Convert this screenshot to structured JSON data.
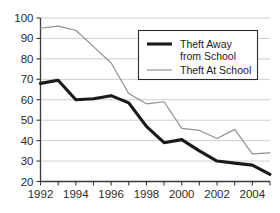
{
  "chart_data": {
    "type": "line",
    "title": "",
    "xlabel": "",
    "ylabel": "",
    "x": [
      1992,
      1993,
      1994,
      1995,
      1996,
      1997,
      1998,
      1999,
      2000,
      2001,
      2002,
      2003,
      2004,
      2005
    ],
    "xlim": [
      1992,
      2005
    ],
    "ylim": [
      20,
      100
    ],
    "yticks": [
      20,
      30,
      40,
      50,
      60,
      70,
      80,
      90,
      100
    ],
    "ytick_labels": [
      "20",
      "30",
      "40",
      "50",
      "60",
      "70",
      "80",
      "90",
      "100"
    ],
    "xtick_labels": [
      "1992",
      "1994",
      "1996",
      "1998",
      "2000",
      "2002",
      "2004"
    ],
    "xticks_labeled": [
      1992,
      1994,
      1996,
      1998,
      2000,
      2002,
      2004
    ],
    "grid": "horizontal",
    "legend_position": "top-right",
    "series": [
      {
        "name": "Theft Away from School",
        "style": "thick-dark",
        "color": "#1a1a1a",
        "values": [
          68,
          69.5,
          60,
          60.5,
          62,
          58.5,
          47,
          39,
          40.5,
          35,
          30,
          29,
          28,
          23.5
        ]
      },
      {
        "name": "Theft At School",
        "style": "thin-gray",
        "color": "#8f8f8f",
        "values": [
          95,
          96,
          94,
          86,
          78,
          63,
          58,
          59,
          46,
          45,
          41,
          45.5,
          33.5,
          34
        ]
      }
    ]
  },
  "legend": {
    "entries": [
      {
        "line1": "Theft Away",
        "line2": "from School"
      },
      {
        "line1": "Theft At School",
        "line2": ""
      }
    ]
  },
  "caption": {
    "text": ""
  }
}
